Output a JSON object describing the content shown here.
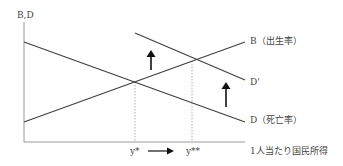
{
  "diagram": {
    "y_axis_label": "B,D",
    "x_axis_label": "1人当たり国民所得",
    "curves": {
      "birth": "B（出生率）",
      "death_shifted": "D'",
      "death": "D（死亡率）"
    },
    "x_ticks": {
      "y_star": "y*",
      "y_star_star": "y**"
    },
    "colors": {
      "line": "#404040",
      "axis": "#9a9a9a",
      "guide": "#9a9a9a",
      "arrow": "#111111"
    }
  }
}
